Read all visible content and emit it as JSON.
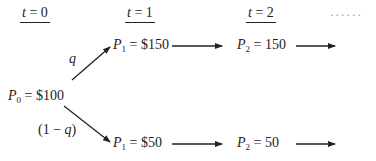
{
  "time_labels": [
    {
      "var": "t",
      "eq": " = ",
      "val": "0"
    },
    {
      "var": "t",
      "eq": " = ",
      "val": "1"
    },
    {
      "var": "t",
      "eq": " = ",
      "val": "2"
    }
  ],
  "continuation": "......",
  "nodes": {
    "p0": {
      "var": "P",
      "sub": "0",
      "rest": " = $100"
    },
    "p1_up": {
      "var": "P",
      "sub": "1",
      "rest": " = $150"
    },
    "p2_up": {
      "var": "P",
      "sub": "2",
      "rest": " = 150"
    },
    "p1_down": {
      "var": "P",
      "sub": "1",
      "rest": " = $50"
    },
    "p2_down": {
      "var": "P",
      "sub": "2",
      "rest": " = 50"
    }
  },
  "probabilities": {
    "up": "q",
    "down_open": "(1 − ",
    "down_var": "q",
    "down_close": ")"
  }
}
